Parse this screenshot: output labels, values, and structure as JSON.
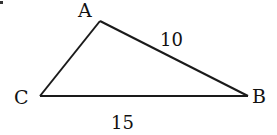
{
  "diagram": {
    "type": "triangle",
    "vertices": {
      "A": {
        "label": "A",
        "x": 100,
        "y": 21
      },
      "B": {
        "label": "B",
        "x": 248,
        "y": 96
      },
      "C": {
        "label": "C",
        "x": 40,
        "y": 96
      }
    },
    "edges": [
      {
        "from": "A",
        "to": "B",
        "length_label": "10"
      },
      {
        "from": "C",
        "to": "B",
        "length_label": "15"
      },
      {
        "from": "C",
        "to": "A",
        "length_label": ""
      }
    ],
    "labels": {
      "vertex_a": "A",
      "vertex_b": "B",
      "vertex_c": "C",
      "side_ab": "10",
      "side_cb": "15"
    },
    "colors": {
      "line": "#1a1a1a",
      "text": "#111111",
      "background": "#ffffff"
    }
  }
}
